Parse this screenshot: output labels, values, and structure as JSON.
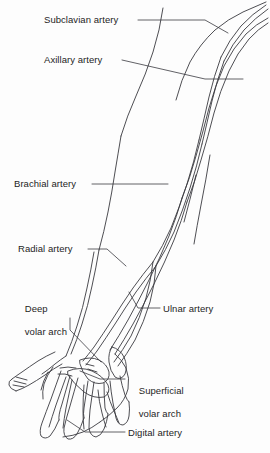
{
  "figure": {
    "type": "anatomical-line-diagram",
    "background_color": "#fdfdfd",
    "line_color": "#3a3a40",
    "text_color": "#1d1d1d"
  },
  "labels": [
    {
      "id": "subclavian-artery",
      "text": "Subclavian artery",
      "lines": [
        "Subclavian artery"
      ],
      "text_x": 44,
      "text_y": 14,
      "align": "left",
      "leader": {
        "x1": 138,
        "y1": 20,
        "x2": 205,
        "y2": 20,
        "x3": 228,
        "y3": 33
      }
    },
    {
      "id": "axillary-artery",
      "text": "Axillary artery",
      "lines": [
        "Axillary artery"
      ],
      "text_x": 44,
      "text_y": 54,
      "align": "left",
      "leader": {
        "x1": 122,
        "y1": 60,
        "x2": 205,
        "y2": 79,
        "x3": 243,
        "y3": 79
      }
    },
    {
      "id": "brachial-artery",
      "text": "Brachial artery",
      "lines": [
        "Brachial artery"
      ],
      "text_x": 14,
      "text_y": 178,
      "align": "left",
      "leader": {
        "x1": 92,
        "y1": 184,
        "x2": 168,
        "y2": 184
      }
    },
    {
      "id": "radial-artery",
      "text": "Radial artery",
      "lines": [
        "Radial artery"
      ],
      "text_x": 18,
      "text_y": 243,
      "align": "left",
      "leader": {
        "x1": 88,
        "y1": 249,
        "x2": 107,
        "y2": 249,
        "x3": 126,
        "y3": 266
      }
    },
    {
      "id": "deep-volar-arch",
      "text": "Deep volar arch",
      "lines": [
        "Deep",
        "volar arch"
      ],
      "text_x": 14,
      "text_y": 291,
      "align": "left",
      "leader": {
        "x1": 70,
        "y1": 318,
        "x2": 70,
        "y2": 330,
        "x3": 101,
        "y3": 362
      }
    },
    {
      "id": "ulnar-artery",
      "text": "Ulnar artery",
      "lines": [
        "Ulnar artery"
      ],
      "text_x": 163,
      "text_y": 303,
      "align": "left",
      "leader": {
        "x1": 160,
        "y1": 308,
        "x2": 138,
        "y2": 308,
        "x3": 129,
        "y3": 292
      }
    },
    {
      "id": "superficial-volar-arch",
      "text": "Superficial volar arch",
      "lines": [
        "Superficial",
        "volar arch"
      ],
      "text_x": 128,
      "text_y": 373,
      "align": "left",
      "leader": {
        "x1": 125,
        "y1": 379,
        "x2": 100,
        "y2": 379,
        "x3": 80,
        "y3": 371
      }
    },
    {
      "id": "digital-artery",
      "text": "Digital artery",
      "lines": [
        "Digital artery"
      ],
      "text_x": 128,
      "text_y": 427,
      "align": "left",
      "leader": {
        "x1": 125,
        "y1": 432,
        "x2": 85,
        "y2": 432,
        "x3": 67,
        "y3": 420
      }
    }
  ],
  "anatomy": {
    "structures": [
      "shoulder-outline",
      "upper-arm-outline",
      "forearm-outline",
      "hand-outline",
      "thumb-outline",
      "finger-1",
      "finger-2",
      "finger-3",
      "finger-4",
      "subclavian-vessel",
      "axillary-vessel",
      "brachial-vessel",
      "radial-vessel",
      "ulnar-vessel",
      "deep-volar-arch-vessel",
      "superficial-volar-arch-vessel",
      "digital-vessels"
    ]
  }
}
